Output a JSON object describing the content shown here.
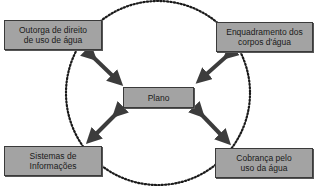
{
  "diagram": {
    "type": "hub-and-spoke",
    "center": {
      "label": "Plano"
    },
    "nodes": [
      {
        "id": "top-left",
        "line1": "Outorga de direito",
        "line2": "de uso de água"
      },
      {
        "id": "top-right",
        "line1": "Enquadramento dos",
        "line2": "corpos d'água"
      },
      {
        "id": "bottom-left",
        "line1": "Sistemas de",
        "line2": "Informações"
      },
      {
        "id": "bottom-right",
        "line1": "Cobrança pelo",
        "line2": "uso da água"
      }
    ],
    "connector": "double-headed arrow",
    "enclosure": "dotted circle"
  },
  "colors": {
    "box_fill": "#a3a3a3",
    "box_border": "#3a3a3a",
    "arrow": "#3c3c3c",
    "circle": "#1a1a1a"
  }
}
